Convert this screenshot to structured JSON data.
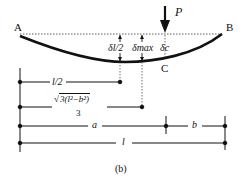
{
  "figure": {
    "caption": "(b)",
    "points": {
      "a_end": "A",
      "b_end": "B",
      "c_point": "C"
    },
    "load": {
      "label": "P"
    },
    "deflections": {
      "half": "δl/2",
      "max": "δmax",
      "c": "δc"
    },
    "dimensions": {
      "half_span": "l/2",
      "max_location_numerator": "3(l²−b²)",
      "max_location_denominator": "3",
      "segment_a": "a",
      "segment_b": "b",
      "span": "l"
    },
    "colors": {
      "ink": "#111111",
      "background": "#ffffff"
    }
  }
}
